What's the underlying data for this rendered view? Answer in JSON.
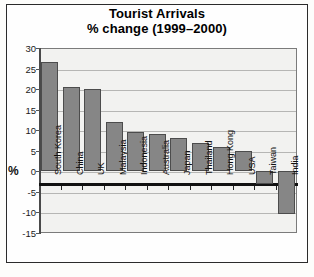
{
  "chart_data": {
    "type": "bar",
    "title": "Tourist Arrivals",
    "subtitle": "% change (1999–2000)",
    "xlabel": "",
    "ylabel": "%",
    "ylim": [
      -15,
      30
    ],
    "yticks": [
      30,
      25,
      20,
      15,
      10,
      5,
      0,
      -5,
      -10,
      -15
    ],
    "ytick_labels": [
      "30",
      "25",
      "20",
      "15",
      "10",
      "5",
      "0",
      "-5",
      "-10",
      "-15"
    ],
    "grid": true,
    "legend": "none",
    "bar_color": "#868686",
    "categories": [
      "South Korea",
      "China",
      "UK",
      "Malaysia",
      "Indonesia",
      "Australia",
      "Japan",
      "Thailand",
      "Hong Kong",
      "USA",
      "Taiwan",
      "India"
    ],
    "values": [
      26.5,
      20.5,
      20,
      12,
      9.5,
      9,
      8,
      7,
      6,
      5,
      -3,
      -10.5
    ]
  }
}
